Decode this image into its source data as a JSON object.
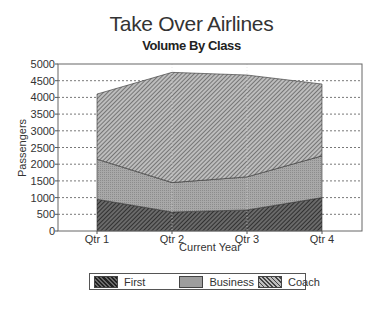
{
  "chart_data": {
    "type": "area",
    "stacked": true,
    "title": "Take Over Airlines",
    "subtitle": "Volume By Class",
    "xlabel": "Current Year",
    "ylabel": "Passengers",
    "categories": [
      "Qtr 1",
      "Qtr 2",
      "Qtr 3",
      "Qtr 4"
    ],
    "series": [
      {
        "name": "First",
        "values": [
          950,
          570,
          630,
          1000
        ]
      },
      {
        "name": "Business",
        "values": [
          1200,
          880,
          990,
          1250
        ]
      },
      {
        "name": "Coach",
        "values": [
          1950,
          3300,
          3050,
          2150
        ]
      }
    ],
    "stack_totals": [
      4100,
      4750,
      4670,
      4400
    ],
    "ylim": [
      0,
      5000
    ],
    "yticks": [
      "0",
      "500",
      "1000",
      "1500",
      "2000",
      "2500",
      "3000",
      "3500",
      "4000",
      "4500",
      "5000"
    ],
    "grid": "horizontal dashed",
    "legend_position": "bottom"
  },
  "legend": {
    "items": [
      {
        "label": "First"
      },
      {
        "label": "Business"
      },
      {
        "label": "Coach"
      }
    ]
  }
}
